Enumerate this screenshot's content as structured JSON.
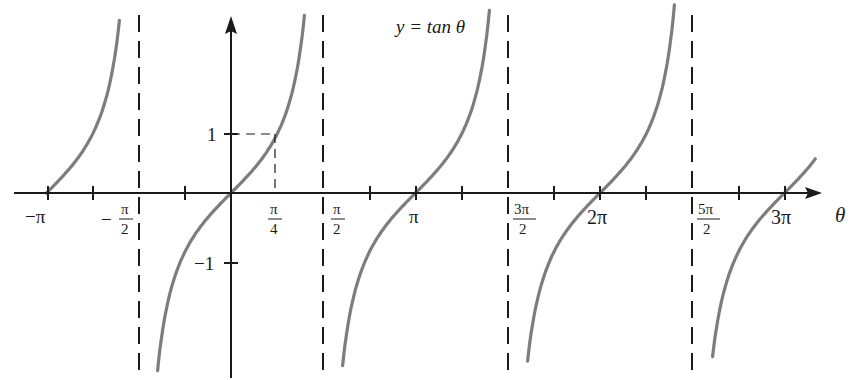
{
  "chart_data": {
    "type": "line",
    "title": "y = tan θ",
    "xlabel": "θ",
    "ylabel": "",
    "function": "tan",
    "xlim": [
      -3.3,
      10.0
    ],
    "ylim": [
      -2.7,
      2.8
    ],
    "x_ticks": [
      {
        "value": -3.1416,
        "label": "−π"
      },
      {
        "value": -1.5708,
        "label": "−π/2"
      },
      {
        "value": 0.7854,
        "label": "π/4"
      },
      {
        "value": 1.5708,
        "label": "π/2"
      },
      {
        "value": 3.1416,
        "label": "π"
      },
      {
        "value": 4.7124,
        "label": "3π/2"
      },
      {
        "value": 6.2832,
        "label": "2π"
      },
      {
        "value": 7.854,
        "label": "5π/2"
      },
      {
        "value": 9.4248,
        "label": "3π"
      }
    ],
    "x_minor_ticks": [
      -2.3562,
      -0.7854,
      2.3562,
      3.927,
      5.4978,
      7.0686,
      8.6394
    ],
    "y_ticks": [
      {
        "value": 1,
        "label": "1"
      },
      {
        "value": -1,
        "label": "−1"
      }
    ],
    "asymptotes": [
      -1.5708,
      1.5708,
      4.7124,
      7.854
    ],
    "annotations": [
      {
        "type": "dashed-guide",
        "point": [
          0.7854,
          1
        ],
        "text": "tan(π/4) = 1"
      }
    ],
    "series": [
      {
        "name": "branch-1",
        "x_range": [
          -3.1416,
          -1.9
        ],
        "sample": [
          [
            -3.1416,
            0
          ],
          [
            -2.3562,
            1
          ],
          [
            -2.0,
            2.19
          ]
        ]
      },
      {
        "name": "branch-2",
        "x_range": [
          -1.25,
          1.25
        ],
        "sample": [
          [
            -1.25,
            -3.0
          ],
          [
            -0.7854,
            -1
          ],
          [
            0,
            0
          ],
          [
            0.7854,
            1
          ],
          [
            1.25,
            3.0
          ]
        ]
      },
      {
        "name": "branch-3",
        "x_range": [
          1.9,
          4.4
        ],
        "sample": [
          [
            1.9,
            -2.9
          ],
          [
            3.1416,
            0
          ],
          [
            3.927,
            1
          ],
          [
            4.4,
            3.2
          ]
        ]
      },
      {
        "name": "branch-4",
        "x_range": [
          5.05,
          7.55
        ],
        "sample": [
          [
            5.05,
            -2.9
          ],
          [
            6.2832,
            0
          ],
          [
            7.0686,
            1
          ],
          [
            7.55,
            3.2
          ]
        ]
      },
      {
        "name": "branch-5",
        "x_range": [
          8.2,
          9.95
        ],
        "sample": [
          [
            8.2,
            -2.7
          ],
          [
            9.4248,
            0
          ],
          [
            9.95,
            0.6
          ]
        ]
      }
    ],
    "grid": false,
    "legend": "none"
  },
  "labels": {
    "title": "y = tan θ",
    "x_axis": "θ",
    "y_one": "1",
    "y_neg_one": "−1",
    "neg_pi": "−π",
    "neg_half_pi_num": "π",
    "neg_half_pi_den": "2",
    "quarter_pi_num": "π",
    "quarter_pi_den": "4",
    "half_pi_num": "π",
    "half_pi_den": "2",
    "pi": "π",
    "three_half_pi_num": "3π",
    "three_half_pi_den": "2",
    "two_pi": "2π",
    "five_half_pi_num": "5π",
    "five_half_pi_den": "2",
    "three_pi": "3π"
  },
  "colors": {
    "curve": "#7d7d7d",
    "axis": "#1a1a1a",
    "asymptote": "#1a1a1a"
  }
}
